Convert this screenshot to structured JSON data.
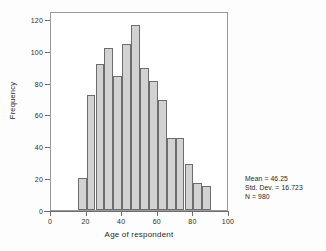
{
  "chart_data": {
    "type": "bar",
    "title": "",
    "xlabel": "Age of respondent",
    "ylabel": "Frequency",
    "xlim": [
      0,
      100
    ],
    "ylim": [
      0,
      125
    ],
    "grid": false,
    "legend": null,
    "bin_width": 5,
    "bin_starts": [
      15,
      20,
      25,
      30,
      35,
      40,
      45,
      50,
      55,
      60,
      65,
      70,
      75,
      80,
      85
    ],
    "categories": [
      "15-20",
      "20-25",
      "25-30",
      "30-35",
      "35-40",
      "40-45",
      "45-50",
      "50-55",
      "55-60",
      "60-65",
      "65-70",
      "70-75",
      "75-80",
      "80-85",
      "85-90"
    ],
    "values": [
      20,
      72,
      92,
      102,
      84,
      104,
      116,
      89,
      81,
      69,
      45,
      45,
      29,
      17,
      15
    ],
    "x_ticks": [
      0,
      20,
      40,
      60,
      80,
      100
    ],
    "y_ticks": [
      0,
      20,
      40,
      60,
      80,
      100,
      120
    ],
    "annotations": [
      "Mean = 46.25",
      "Std. Dev. = 16.723",
      "N = 980"
    ],
    "bar_fill": "#d2d2d2",
    "bar_edge": "#6d6d6d"
  },
  "stats": {
    "mean": "Mean = 46.25",
    "std_dev": "Std. Dev. = 16.723",
    "n": "N = 980"
  },
  "axes": {
    "x_title": "Age of respondent",
    "y_title": "Frequency"
  }
}
